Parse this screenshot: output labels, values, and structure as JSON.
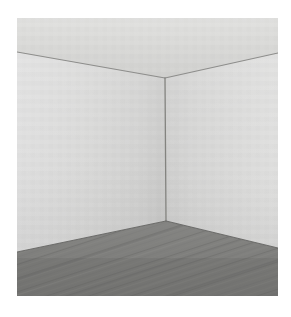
{
  "scene": {
    "title": "Empty room interior corner",
    "description": "Perspective render of an empty room showing two adjoining light gray walls, a ceiling, and a gray wood-plank floor meeting at a central vertical corner.",
    "canvas": {
      "width": 291,
      "height": 317,
      "background": "#ffffff"
    },
    "image_bounds": {
      "x": 17,
      "y": 18,
      "width": 261,
      "height": 278
    }
  },
  "geometry": {
    "corner_top": {
      "x": 148,
      "y": 60,
      "label": "ceiling-corner-apex"
    },
    "corner_bottom": {
      "x": 149,
      "y": 203,
      "label": "floor-corner-vertex"
    },
    "ceiling_left_edge": {
      "x": 0,
      "y": 34
    },
    "ceiling_right_edge": {
      "x": 261,
      "y": 35
    },
    "floor_left_edge": {
      "x": 0,
      "y": 234
    },
    "floor_right_edge": {
      "x": 261,
      "y": 230
    }
  },
  "surfaces": [
    {
      "name": "ceiling",
      "label": "Ceiling",
      "color_top": "#dededc",
      "color_bottom": "#d2d2d0",
      "edge_color": "#8d8d8b"
    },
    {
      "name": "left-wall",
      "label": "Left wall",
      "color_near": "#dcdcda",
      "color_far": "#cbcbc9",
      "edge_color": "#8a8a88"
    },
    {
      "name": "right-wall",
      "label": "Right wall",
      "color_near": "#d1d1cf",
      "color_far": "#dcdcda",
      "edge_color": "#8a8a88"
    },
    {
      "name": "floor",
      "label": "Wood plank floor",
      "color_near": "#8f8f8d",
      "color_far": "#9b9b99",
      "plank_dark": "#7e7e7c",
      "plank_light": "#a2a2a0",
      "baseboard_shadow": "#6f6f6d"
    }
  ],
  "floor_texture": {
    "type": "diagonal-planks",
    "plank_angle_deg": -18,
    "plank_count": 34,
    "seam_color": "#6e6e6c"
  },
  "edges": [
    {
      "name": "ceiling-left-line",
      "from": [
        0,
        34
      ],
      "to": [
        148,
        60
      ],
      "color": "#8d8d8b",
      "width": 1.1
    },
    {
      "name": "ceiling-right-line",
      "from": [
        148,
        60
      ],
      "to": [
        261,
        35
      ],
      "color": "#8d8d8b",
      "width": 1.1
    },
    {
      "name": "wall-corner-line",
      "from": [
        148,
        60
      ],
      "to": [
        149,
        203
      ],
      "color": "#83837f",
      "width": 1.3
    },
    {
      "name": "floor-left-line",
      "from": [
        0,
        234
      ],
      "to": [
        149,
        203
      ],
      "color": "#6b6b69",
      "width": 1.2
    },
    {
      "name": "floor-right-line",
      "from": [
        149,
        203
      ],
      "to": [
        261,
        230
      ],
      "color": "#6b6b69",
      "width": 1.2
    }
  ]
}
